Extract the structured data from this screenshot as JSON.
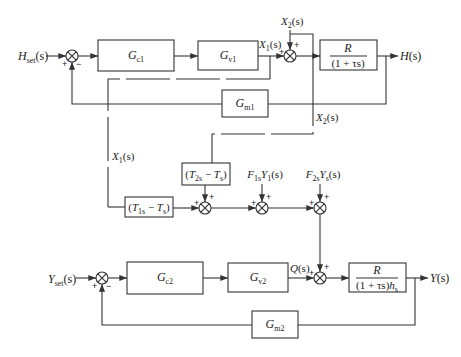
{
  "signals": {
    "h_set": {
      "main": "H",
      "sub": "set",
      "tail": "(s)"
    },
    "h_out": {
      "main": "H",
      "tail": "(s)"
    },
    "x1_top": {
      "main": "X",
      "sub": "1",
      "tail": "(s)"
    },
    "x2_top": {
      "main": "X",
      "sub": "2",
      "tail": "(s)"
    },
    "x2_mid": {
      "main": "X",
      "sub": "2",
      "tail": "(s)"
    },
    "x1_mid": {
      "main": "X",
      "sub": "1",
      "tail": "(s)"
    },
    "f1s_y1": {
      "main": "F",
      "sub": "1s",
      "main2": "Y",
      "sub2": "1",
      "tail": "(s)"
    },
    "f2s_ys": {
      "main": "F",
      "sub": "2s",
      "main2": "Y",
      "sub2": "s",
      "tail": "(s)"
    },
    "y_set": {
      "main": "Y",
      "sub": "set",
      "tail": "(s)"
    },
    "q": {
      "main": "Q",
      "tail": "(s)"
    },
    "y_out": {
      "main": "Y",
      "tail": "(s)"
    }
  },
  "blocks": {
    "gc1": {
      "main": "G",
      "sub": "c1"
    },
    "gv1": {
      "main": "G",
      "sub": "v1"
    },
    "gm1": {
      "main": "G",
      "sub": "m1"
    },
    "process1": {
      "num": "R",
      "den": "(1 + τs)"
    },
    "t1s": {
      "open": "(",
      "main": "T",
      "sub": "1s",
      "op": " − ",
      "main2": "T",
      "sub2": "s",
      "close": ")"
    },
    "t2s": {
      "open": "(",
      "main": "T",
      "sub": "2s",
      "op": " − ",
      "main2": "T",
      "sub2": "s",
      "close": ")"
    },
    "gc2": {
      "main": "G",
      "sub": "c2"
    },
    "gv2": {
      "main": "G",
      "sub": "v2"
    },
    "gm2": {
      "main": "G",
      "sub": "m2"
    },
    "process2": {
      "num": "R",
      "den": "(1 + τs)",
      "den_main": "h",
      "den_sub": "s"
    }
  },
  "signs": {
    "plus": "+",
    "minus": "−"
  },
  "colors": {
    "line": "#333333",
    "background": "#ffffff"
  }
}
